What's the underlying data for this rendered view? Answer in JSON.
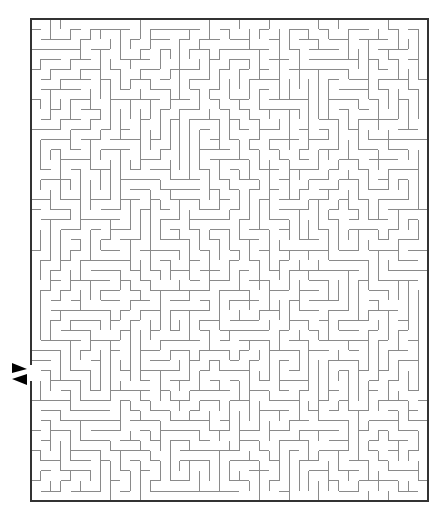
{
  "puzzle": {
    "type": "maze",
    "cols": 40,
    "rows": 48,
    "seed": 7,
    "border": {
      "x": 31,
      "y": 19,
      "width": 397,
      "height": 482,
      "color": "#333333"
    },
    "wall_color": "#8a8a8a",
    "entrance": {
      "side": "left",
      "y": 373,
      "arrows": [
        "in",
        "out"
      ]
    },
    "arrow_color": "#000000"
  }
}
